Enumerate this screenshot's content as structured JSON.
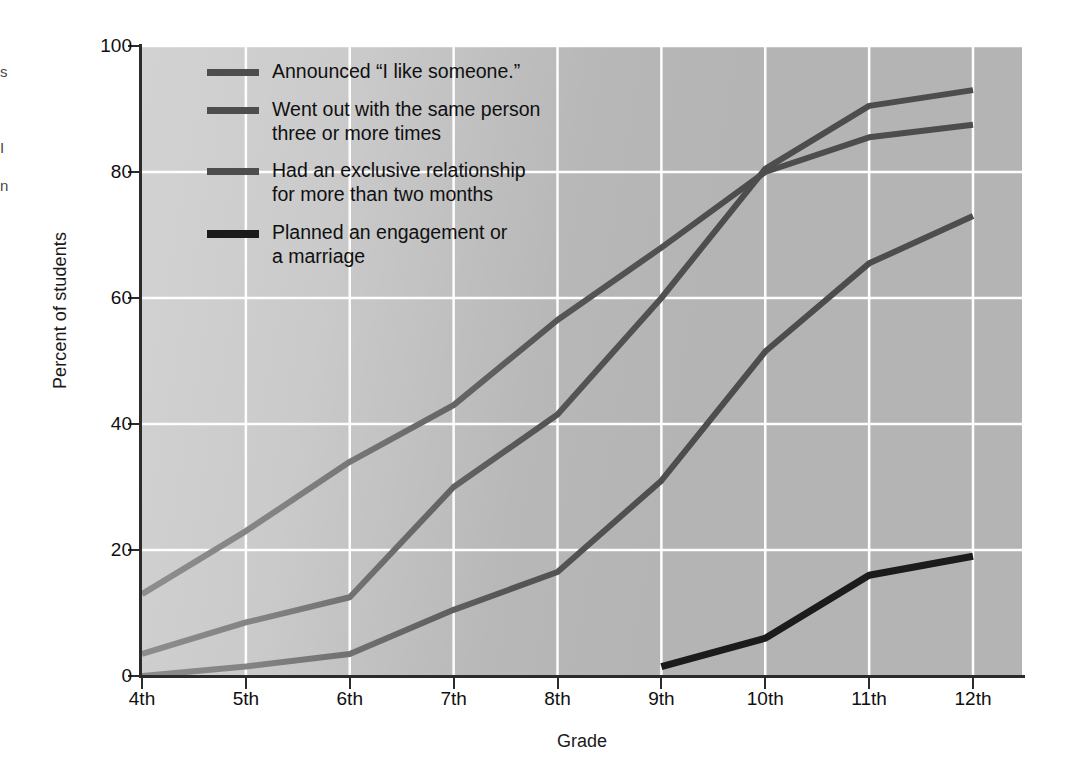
{
  "figure": {
    "background_color": "#ffffff",
    "plot_background_color": "#b5b5b5",
    "gridline_color": "#ffffff",
    "axis_color": "#2b2b2b"
  },
  "edge_fragments": {
    "frag1": "s",
    "frag2": "I",
    "frag3": "n"
  },
  "chart_data": {
    "type": "line",
    "title": "",
    "subtitle": "",
    "xlabel": "Grade",
    "ylabel": "Percent of students",
    "categories": [
      "4th",
      "5th",
      "6th",
      "7th",
      "8th",
      "9th",
      "10th",
      "11th",
      "12th"
    ],
    "x": [
      4,
      5,
      6,
      7,
      8,
      9,
      10,
      11,
      12
    ],
    "ylim": [
      0,
      100
    ],
    "yticks": [
      0,
      20,
      40,
      60,
      80,
      100
    ],
    "ytick_labels": [
      "0",
      "20",
      "40",
      "60",
      "80",
      "100"
    ],
    "grid": true,
    "grid_axis": "both",
    "legend_position": "upper-left-inside",
    "series": [
      {
        "name": "Announced “I like someone.”",
        "color": "#4d4d4d",
        "linewidth": 6,
        "values": [
          13,
          23,
          34,
          43,
          56.5,
          68,
          80,
          85.5,
          87.5
        ]
      },
      {
        "name": "Went out with the same person three or more times",
        "color": "#4d4d4d",
        "linewidth": 6,
        "values": [
          3.5,
          8.5,
          12.5,
          30,
          41.5,
          60,
          80.5,
          90.5,
          93
        ]
      },
      {
        "name": "Had an exclusive relationship for more than two months",
        "color": "#4d4d4d",
        "linewidth": 6,
        "values": [
          0,
          1.5,
          3.5,
          10.5,
          16.5,
          31,
          51.5,
          65.5,
          73
        ]
      },
      {
        "name": "Planned an engagement or a marriage",
        "color": "#1b1b1b",
        "linewidth": 7,
        "values": [
          null,
          null,
          null,
          null,
          null,
          1.5,
          6,
          16,
          19
        ]
      }
    ]
  },
  "legend": {
    "entries": [
      {
        "label": "Announced “I like someone.”",
        "swatch_color": "#4d4d4d"
      },
      {
        "label": "Went out with the same person\nthree or more times",
        "swatch_color": "#4d4d4d"
      },
      {
        "label": "Had an exclusive relationship\nfor more than two months",
        "swatch_color": "#4d4d4d"
      },
      {
        "label": "Planned an engagement or\na marriage",
        "swatch_color": "#1b1b1b"
      }
    ]
  }
}
